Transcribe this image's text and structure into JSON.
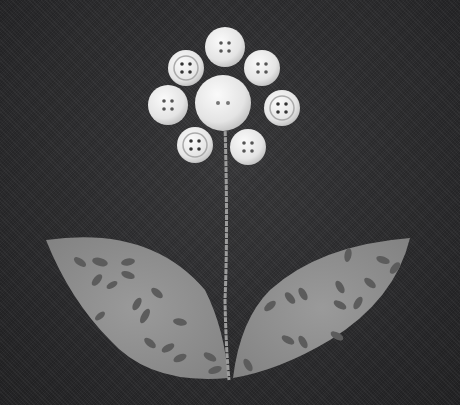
{
  "image": {
    "subject": "Fabric applique flower made of buttons on denim background",
    "background_color": "#2c2c2e",
    "stem_color": "#9a9a9a",
    "leaf_color": "#8e8e8e",
    "leaf_pattern_color": "#5a5a5a",
    "button_color": "#e8e8e8",
    "buttons": [
      {
        "name": "center",
        "cx": 223,
        "cy": 103,
        "r": 28,
        "holes": 2
      },
      {
        "name": "top",
        "cx": 225,
        "cy": 47,
        "r": 20,
        "holes": 4
      },
      {
        "name": "top-left",
        "cx": 186,
        "cy": 68,
        "r": 18,
        "holes": 4
      },
      {
        "name": "top-right",
        "cx": 262,
        "cy": 68,
        "r": 18,
        "holes": 4
      },
      {
        "name": "left",
        "cx": 168,
        "cy": 105,
        "r": 20,
        "holes": 4
      },
      {
        "name": "right",
        "cx": 282,
        "cy": 108,
        "r": 18,
        "holes": 4
      },
      {
        "name": "bottom-left",
        "cx": 195,
        "cy": 145,
        "r": 18,
        "holes": 4
      },
      {
        "name": "bottom-right",
        "cx": 248,
        "cy": 147,
        "r": 18,
        "holes": 4
      }
    ]
  }
}
